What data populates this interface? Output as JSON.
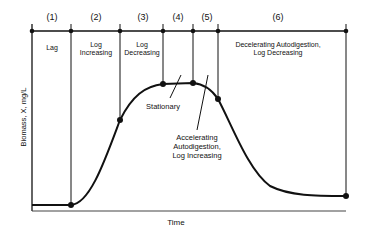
{
  "diagram": {
    "axes": {
      "ylabel": "Biomass, X, mg/L",
      "xlabel": "Time"
    },
    "phases": [
      {
        "number": "(1)",
        "label_lines": [
          "Lag"
        ]
      },
      {
        "number": "(2)",
        "label_lines": [
          "Log",
          "Increasing"
        ]
      },
      {
        "number": "(3)",
        "label_lines": [
          "Log",
          "Decreasing"
        ]
      },
      {
        "number": "(4)",
        "label_lines": []
      },
      {
        "number": "(5)",
        "label_lines": []
      },
      {
        "number": "(6)",
        "label_lines": [
          "Decelerating Autodigestion,",
          "Log Decreasing"
        ]
      }
    ],
    "callouts": {
      "stationary": "Stationary",
      "accelerating": [
        "Accelerating",
        "Autodigestion,",
        "Log Increasing"
      ]
    },
    "colors": {
      "line": "#111111",
      "background": "#ffffff"
    }
  }
}
